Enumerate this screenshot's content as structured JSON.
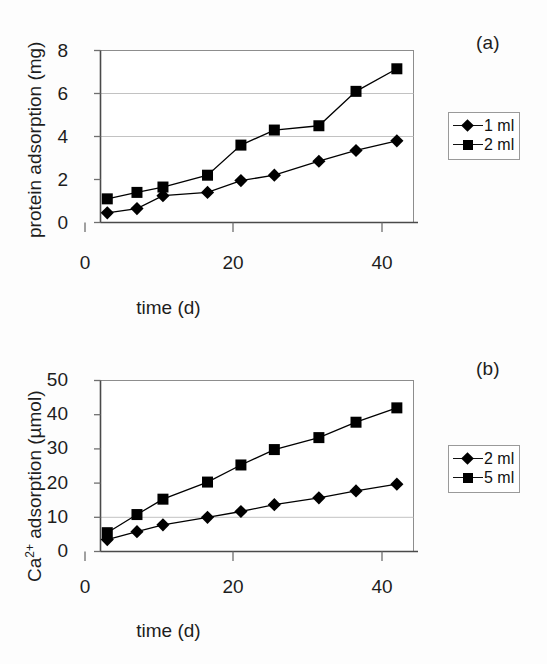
{
  "figure": {
    "panels": [
      {
        "id": "a",
        "label": "(a)"
      },
      {
        "id": "b",
        "label": "(b)"
      }
    ]
  },
  "chart_data": [
    {
      "type": "line",
      "panel": "(a)",
      "title": "",
      "xlabel": "time (d)",
      "ylabel": "protein adsorption (mg)",
      "xlim": [
        0,
        45
      ],
      "ylim": [
        0,
        8
      ],
      "xticks": [
        0,
        20,
        40
      ],
      "xticklabels": [
        "0",
        "20",
        "40"
      ],
      "yticks": [
        0,
        2,
        4,
        6,
        8
      ],
      "yticklabels": [
        "0",
        "2",
        "4",
        "6",
        "8"
      ],
      "grid": "horizontal",
      "gridlines_y": [
        4,
        6
      ],
      "legend_position": "right",
      "x": [
        3,
        7,
        10.5,
        16.5,
        21,
        25.5,
        31.5,
        36.5,
        42
      ],
      "series": [
        {
          "name": "1 ml",
          "marker": "diamond",
          "color": "#000000",
          "values": [
            0.45,
            0.65,
            1.25,
            1.4,
            1.95,
            2.2,
            2.85,
            3.35,
            3.8
          ]
        },
        {
          "name": "2 ml",
          "marker": "square",
          "color": "#000000",
          "values": [
            1.1,
            1.4,
            1.65,
            2.2,
            3.6,
            4.3,
            4.5,
            6.1,
            7.15
          ]
        }
      ]
    },
    {
      "type": "line",
      "panel": "(b)",
      "title": "",
      "xlabel": "time (d)",
      "ylabel": "Ca2+ adsorption (µmol)",
      "ylabel_base": "Ca",
      "ylabel_sup": "2+",
      "ylabel_rest": " adsorption (µmol)",
      "xlim": [
        0,
        45
      ],
      "ylim": [
        0,
        50
      ],
      "xticks": [
        0,
        20,
        40
      ],
      "xticklabels": [
        "0",
        "20",
        "40"
      ],
      "yticks": [
        0,
        10,
        20,
        30,
        40,
        50
      ],
      "yticklabels": [
        "0",
        "10",
        "20",
        "30",
        "40",
        "50"
      ],
      "grid": "horizontal",
      "gridlines_y": [
        10
      ],
      "legend_position": "right",
      "x": [
        3,
        7,
        10.5,
        16.5,
        21,
        25.5,
        31.5,
        36.5,
        42
      ],
      "series": [
        {
          "name": "2 ml",
          "marker": "diamond",
          "color": "#000000",
          "values": [
            3.5,
            5.8,
            7.8,
            10,
            11.7,
            13.7,
            15.7,
            17.7,
            19.7
          ]
        },
        {
          "name": "5 ml",
          "marker": "square",
          "color": "#000000",
          "values": [
            5.5,
            10.8,
            15.3,
            20.3,
            25.3,
            29.8,
            33.3,
            37.8,
            42
          ]
        }
      ]
    }
  ]
}
